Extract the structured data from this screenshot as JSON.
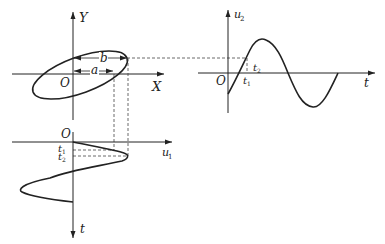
{
  "diagram": {
    "xy_plot": {
      "x_axis_label": "X",
      "y_axis_label": "Y",
      "origin_label": "O",
      "dimension_a_label": "a",
      "dimension_b_label": "b"
    },
    "u2_plot": {
      "y_axis_label": "u",
      "y_axis_subscript": "2",
      "x_axis_label": "t",
      "origin_label": "O",
      "t1_label": "t",
      "t1_subscript": "1",
      "t2_label": "t",
      "t2_subscript": "2"
    },
    "u1_plot": {
      "x_axis_label": "u",
      "x_axis_subscript": "1",
      "y_axis_label": "t",
      "origin_label": "O",
      "t1_label": "t",
      "t1_subscript": "1",
      "t2_label": "t",
      "t2_subscript": "2"
    }
  },
  "colors": {
    "line": "#222222",
    "dash": "#444444",
    "background": "#ffffff"
  }
}
